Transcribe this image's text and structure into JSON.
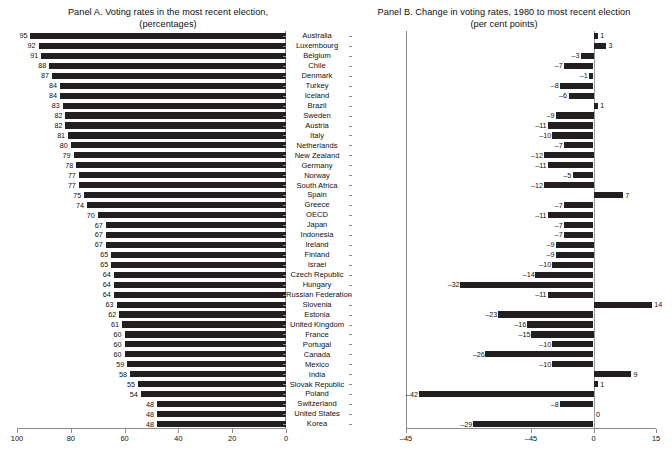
{
  "panel_a": {
    "title_line1": "Panel A. Voting rates in the most recent election,",
    "title_line2": "(percentages)",
    "axis_ticks": [
      "100",
      "80",
      "60",
      "40",
      "20",
      "0"
    ]
  },
  "panel_b": {
    "title_line1": "Panel B. Change in voting rates, 1980 to most recent election",
    "title_line2": "(per cent points)",
    "axis_ticks": [
      "–45",
      "–45",
      "0",
      "15"
    ]
  },
  "chart_data": {
    "type": "bar",
    "orientation": "horizontal",
    "categories": [
      "Australia",
      "Luxembourg",
      "Belgium",
      "Chile",
      "Denmark",
      "Turkey",
      "Iceland",
      "Brazil",
      "Sweden",
      "Austria",
      "Italy",
      "Netherlands",
      "New Zealand",
      "Germany",
      "Norway",
      "South Africa",
      "Spain",
      "Greece",
      "OECD",
      "Japan",
      "Indonesia",
      "Ireland",
      "Finland",
      "Israel",
      "Czech Republic",
      "Hungary",
      "Russian Federation",
      "Slovenia",
      "Estonia",
      "United Kingdom",
      "France",
      "Portugal",
      "Canada",
      "Mexico",
      "India",
      "Slovak Republic",
      "Poland",
      "Switzerland",
      "United States",
      "Korea"
    ],
    "series": [
      {
        "name": "Voting rates in the most recent election (percentages)",
        "panel": "A",
        "xlabel": "",
        "ylabel": "",
        "xlim": [
          100,
          0
        ],
        "reversed": true,
        "values": [
          95,
          92,
          91,
          88,
          87,
          84,
          84,
          83,
          82,
          82,
          81,
          80,
          79,
          78,
          77,
          77,
          75,
          74,
          70,
          67,
          67,
          67,
          65,
          65,
          64,
          64,
          64,
          63,
          62,
          61,
          60,
          60,
          60,
          59,
          58,
          55,
          54,
          48,
          48,
          48
        ]
      },
      {
        "name": "Change in voting rates, 1980 to most recent election (per cent points)",
        "panel": "B",
        "xlabel": "",
        "ylabel": "",
        "xlim": [
          -45,
          15
        ],
        "values": [
          1,
          3,
          -3,
          -7,
          -1,
          -8,
          -6,
          1,
          -9,
          -11,
          -10,
          -7,
          -12,
          -11,
          -5,
          -12,
          7,
          -7,
          -11,
          -7,
          -7,
          -9,
          -9,
          -10,
          -14,
          -32,
          -11,
          14,
          -23,
          -16,
          -15,
          -10,
          -26,
          -10,
          9,
          1,
          -42,
          -8,
          0,
          -29
        ],
        "extra_note": "Korea = -32"
      }
    ],
    "grid": false,
    "legend": "none"
  },
  "colors": {
    "bar": "#231f1e",
    "axis": "#8d8d8d",
    "zero_line": "#9a9a9a",
    "text": "#111111",
    "background": "#ffffff"
  }
}
